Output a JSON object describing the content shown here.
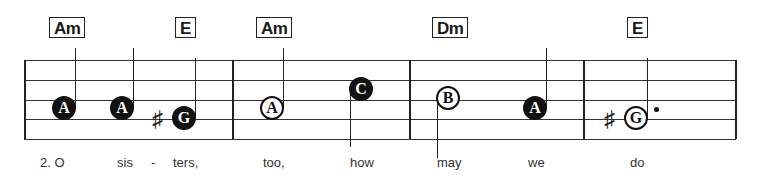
{
  "chords": [
    {
      "label": "Am",
      "x": 49
    },
    {
      "label": "E",
      "x": 175
    },
    {
      "label": "Am",
      "x": 256
    },
    {
      "label": "Dm",
      "x": 432
    },
    {
      "label": "E",
      "x": 627
    }
  ],
  "notes": [
    {
      "letter": "A",
      "style": "filled",
      "x": 64,
      "y": 108,
      "stem": "up",
      "sharp": false,
      "dot": false
    },
    {
      "letter": "A",
      "style": "filled",
      "x": 122,
      "y": 108,
      "stem": "up",
      "sharp": false,
      "dot": false
    },
    {
      "letter": "G",
      "style": "filled",
      "x": 184,
      "y": 118,
      "stem": "up",
      "sharp": true,
      "dot": false
    },
    {
      "letter": "A",
      "style": "open",
      "x": 272,
      "y": 108,
      "stem": "up",
      "sharp": false,
      "dot": false
    },
    {
      "letter": "C",
      "style": "filled",
      "x": 361,
      "y": 89,
      "stem": "down",
      "sharp": false,
      "dot": false
    },
    {
      "letter": "B",
      "style": "open",
      "x": 448,
      "y": 98,
      "stem": "down",
      "sharp": false,
      "dot": false
    },
    {
      "letter": "A",
      "style": "filled",
      "x": 535,
      "y": 108,
      "stem": "up",
      "sharp": false,
      "dot": false
    },
    {
      "letter": "G",
      "style": "open",
      "x": 636,
      "y": 118,
      "stem": "up",
      "sharp": true,
      "dot": true
    }
  ],
  "lyrics": [
    {
      "text": "2.  O",
      "x": 40
    },
    {
      "text": "sis",
      "x": 117
    },
    {
      "text": "-",
      "x": 151
    },
    {
      "text": "ters,",
      "x": 173
    },
    {
      "text": "too,",
      "x": 263
    },
    {
      "text": "how",
      "x": 350
    },
    {
      "text": "may",
      "x": 437
    },
    {
      "text": "we",
      "x": 528
    },
    {
      "text": "do",
      "x": 630
    }
  ],
  "staff": {
    "lines_y": [
      60,
      80,
      100,
      119,
      139
    ],
    "left": 24,
    "right": 736,
    "barlines_x": [
      24,
      232,
      409,
      583,
      735
    ]
  }
}
